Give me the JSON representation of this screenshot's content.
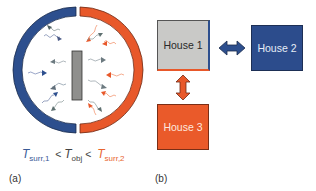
{
  "figure": {
    "panel_a": {
      "label": "(a)",
      "equation": {
        "left_symbol": "T",
        "left_sub": "surr,1",
        "op1": "<",
        "mid_symbol": "T",
        "mid_sub": "obj",
        "op2": "<",
        "right_symbol": "T",
        "right_sub": "surr,2"
      },
      "colors": {
        "cold_surround": "#2d4f8e",
        "hot_surround": "#e8582a",
        "object": "#8f8f8d"
      }
    },
    "panel_b": {
      "label": "(b)",
      "houses": [
        {
          "name": "House 1",
          "color": "#c9c9c7"
        },
        {
          "name": "House 2",
          "color": "#2c4c8c"
        },
        {
          "name": "House 3",
          "color": "#ea5a2a"
        }
      ],
      "arrows": [
        {
          "between": "House 1 - House 2",
          "color": "#2d4f8e"
        },
        {
          "between": "House 1 - House 3",
          "color": "#e8582a"
        }
      ]
    }
  }
}
